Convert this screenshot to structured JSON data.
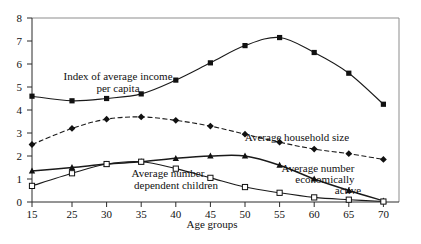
{
  "chart_data": {
    "type": "line",
    "title": "",
    "xlabel": "Age groups",
    "ylabel": "",
    "x": [
      15,
      25,
      30,
      35,
      40,
      45,
      50,
      55,
      60,
      65,
      70
    ],
    "xtick_labels": [
      "15",
      "25",
      "30",
      "35",
      "40",
      "45",
      "50",
      "55",
      "60",
      "65",
      "70"
    ],
    "ytick_labels": [
      "0",
      "1",
      "2",
      "3",
      "4",
      "5",
      "6",
      "7",
      "8"
    ],
    "ylim": [
      0,
      8
    ],
    "grid": false,
    "legend_position": "inline-annotations",
    "series": [
      {
        "name": "Index of average income per capita",
        "marker": "filled-square",
        "linestyle": "solid",
        "values": [
          4.6,
          4.4,
          4.5,
          4.7,
          5.3,
          6.05,
          6.8,
          7.15,
          6.5,
          5.6,
          4.25
        ]
      },
      {
        "name": "Average household size",
        "marker": "filled-diamond",
        "linestyle": "dashed",
        "values": [
          2.5,
          3.2,
          3.6,
          3.7,
          3.55,
          3.3,
          2.95,
          2.6,
          2.3,
          2.1,
          1.85
        ]
      },
      {
        "name": "Average number economically active",
        "marker": "filled-triangle",
        "linestyle": "solid",
        "values": [
          1.35,
          1.5,
          1.65,
          1.75,
          1.9,
          2.0,
          2.0,
          1.6,
          1.0,
          0.5,
          0.05
        ]
      },
      {
        "name": "Average number dependent children",
        "marker": "open-square",
        "linestyle": "solid",
        "values": [
          0.7,
          1.25,
          1.65,
          1.75,
          1.45,
          1.05,
          0.65,
          0.4,
          0.2,
          0.1,
          0.02
        ]
      }
    ],
    "annotations": [
      {
        "id": "income",
        "line1": "Index of average income",
        "line2": "per capita"
      },
      {
        "id": "household",
        "line1": "Average household size",
        "line2": ""
      },
      {
        "id": "active",
        "line1": "Average number",
        "line2": "economically",
        "line3": "active"
      },
      {
        "id": "children",
        "line1": "Average number",
        "line2": "dependent children"
      }
    ],
    "colors": {
      "line": "#1a1a1a",
      "axis": "#2b2b2b",
      "frame": "#8d8d8d",
      "background": "#ffffff",
      "text": "#111111"
    }
  }
}
